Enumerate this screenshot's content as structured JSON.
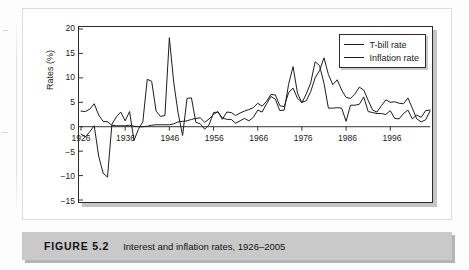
{
  "figure": {
    "caption_number": "FIGURE 5.2",
    "caption_title": "Interest and inflation rates, 1926–2005"
  },
  "chart_data": {
    "type": "line",
    "title": "",
    "xlabel": "",
    "ylabel": "Rates (%)",
    "xlim": [
      1926,
      2005
    ],
    "ylim": [
      -15,
      20
    ],
    "y_ticks": [
      20,
      15,
      10,
      5,
      0,
      -5,
      -10,
      -15
    ],
    "y_tick_labels": [
      "20",
      "15",
      "10",
      "5",
      "0",
      "−5",
      "−10",
      "−15"
    ],
    "x_ticks": [
      1926,
      1936,
      1946,
      1956,
      1966,
      1976,
      1986,
      1996
    ],
    "x_tick_labels": [
      "1926",
      "1936",
      "1946",
      "1956",
      "1966",
      "1976",
      "1986",
      "1996"
    ],
    "grid": false,
    "legend_position": "top-right",
    "line_color": "#1a1a1a",
    "x": [
      1926,
      1927,
      1928,
      1929,
      1930,
      1931,
      1932,
      1933,
      1934,
      1935,
      1936,
      1937,
      1938,
      1939,
      1940,
      1941,
      1942,
      1943,
      1944,
      1945,
      1946,
      1947,
      1948,
      1949,
      1950,
      1951,
      1952,
      1953,
      1954,
      1955,
      1956,
      1957,
      1958,
      1959,
      1960,
      1961,
      1962,
      1963,
      1964,
      1965,
      1966,
      1967,
      1968,
      1969,
      1970,
      1971,
      1972,
      1973,
      1974,
      1975,
      1976,
      1977,
      1978,
      1979,
      1980,
      1981,
      1982,
      1983,
      1984,
      1985,
      1986,
      1987,
      1988,
      1989,
      1990,
      1991,
      1992,
      1993,
      1994,
      1995,
      1996,
      1997,
      1998,
      1999,
      2000,
      2001,
      2002,
      2003,
      2004,
      2005
    ],
    "series": [
      {
        "name": "T-bill rate",
        "values": [
          3.2,
          3.1,
          3.6,
          4.7,
          2.4,
          1.1,
          1.0,
          0.3,
          0.2,
          0.2,
          0.2,
          0.3,
          0.1,
          0.0,
          0.0,
          0.1,
          0.3,
          0.4,
          0.4,
          0.4,
          0.4,
          0.6,
          1.0,
          1.1,
          1.2,
          1.5,
          1.7,
          1.8,
          0.9,
          1.6,
          2.5,
          3.1,
          1.5,
          3.0,
          2.9,
          2.3,
          2.8,
          3.2,
          3.5,
          3.9,
          4.8,
          4.2,
          5.2,
          6.6,
          6.5,
          4.3,
          4.1,
          7.0,
          7.9,
          5.8,
          5.0,
          5.3,
          7.2,
          10.0,
          11.5,
          14.1,
          10.7,
          8.6,
          9.6,
          7.5,
          6.0,
          5.8,
          6.7,
          8.1,
          7.5,
          5.4,
          3.4,
          3.0,
          4.3,
          5.5,
          5.0,
          5.1,
          4.8,
          4.7,
          5.9,
          3.8,
          1.6,
          1.0,
          1.4,
          3.2
        ]
      },
      {
        "name": "Inflation rate",
        "values": [
          -1.5,
          -2.1,
          -1.0,
          0.2,
          -6.0,
          -9.5,
          -10.3,
          0.5,
          2.0,
          3.0,
          1.2,
          3.1,
          -2.8,
          -0.5,
          1.0,
          9.7,
          9.3,
          3.2,
          2.1,
          2.3,
          18.2,
          9.0,
          2.7,
          -1.8,
          5.8,
          5.9,
          0.9,
          0.6,
          -0.5,
          0.4,
          2.9,
          3.0,
          1.8,
          1.5,
          1.5,
          0.7,
          1.2,
          1.7,
          1.2,
          1.9,
          3.4,
          3.0,
          4.7,
          6.2,
          5.6,
          3.3,
          3.4,
          8.7,
          12.3,
          6.9,
          4.9,
          6.7,
          9.0,
          13.3,
          12.5,
          8.9,
          3.8,
          3.8,
          3.9,
          3.8,
          1.1,
          4.4,
          4.4,
          4.6,
          6.1,
          3.1,
          2.9,
          2.7,
          2.7,
          2.5,
          3.3,
          1.7,
          1.6,
          2.7,
          3.4,
          1.6,
          2.4,
          1.9,
          3.3,
          3.4
        ]
      }
    ]
  }
}
